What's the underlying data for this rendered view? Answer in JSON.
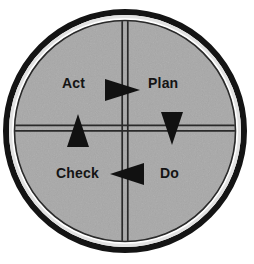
{
  "diagram": {
    "type": "cycle-wheel",
    "background_color": "#ffffff",
    "fill_color": "#a8a8a8",
    "ring_color": "#141414",
    "divider_color": "#2a2a2a",
    "arrow_color": "#111111",
    "label_color": "#141414",
    "geometry": {
      "center_x": 125,
      "center_y": 131,
      "outer_radius": 120,
      "ring_thickness": 5,
      "inner_radius": 110,
      "divider_x": 125,
      "divider_y": 128
    },
    "quadrants": [
      {
        "id": "act",
        "label": "Act",
        "position": "upper-left"
      },
      {
        "id": "plan",
        "label": "Plan",
        "position": "upper-right"
      },
      {
        "id": "check",
        "label": "Check",
        "position": "lower-left"
      },
      {
        "id": "do",
        "label": "Do",
        "position": "lower-right"
      }
    ],
    "arrows": [
      {
        "id": "act-to-plan",
        "icon": "arrow-right-icon",
        "direction": "right",
        "from": "Act",
        "to": "Plan"
      },
      {
        "id": "plan-to-do",
        "icon": "arrow-down-icon",
        "direction": "down",
        "from": "Plan",
        "to": "Do"
      },
      {
        "id": "do-to-check",
        "icon": "arrow-left-icon",
        "direction": "left",
        "from": "Do",
        "to": "Check"
      },
      {
        "id": "check-to-act",
        "icon": "arrow-up-icon",
        "direction": "up",
        "from": "Check",
        "to": "Act"
      }
    ]
  }
}
